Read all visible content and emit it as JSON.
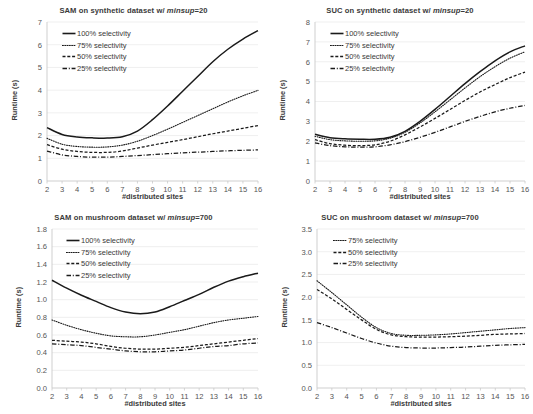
{
  "figure": {
    "panel_count": 4,
    "series_styles": {
      "100": "solid",
      "75": "dotted",
      "50": "dashed",
      "25": "dash-dot"
    },
    "colors": {
      "line": "#1a1a1a",
      "grid": "#e8e8e8",
      "axis": "#c9c9c9",
      "text": "#3a3a3a",
      "tick": "#555555",
      "background": "#ffffff"
    }
  },
  "charts": [
    {
      "id": "sam-synthetic",
      "title_prefix": "SAM on synthetic dataset w/ ",
      "title_italic": "minsup",
      "title_suffix": "=20",
      "title_full": "SAM on synthetic dataset w/ minsup=20",
      "chart_data": {
        "type": "line",
        "title": "SAM on synthetic dataset w/ minsup=20",
        "xlabel": "#distributed sites",
        "ylabel": "Runtime (s)",
        "x": [
          2,
          3,
          4,
          5,
          6,
          7,
          8,
          9,
          10,
          11,
          12,
          13,
          14,
          15,
          16
        ],
        "xlim": [
          2,
          16
        ],
        "ylim": [
          0,
          7
        ],
        "yticks": [
          0,
          1,
          2,
          3,
          4,
          5,
          6,
          7
        ],
        "xticks": [
          2,
          3,
          4,
          5,
          6,
          7,
          8,
          9,
          10,
          11,
          12,
          13,
          14,
          15,
          16
        ],
        "grid": true,
        "legend": "upper left",
        "series": [
          {
            "name": "100% selectivity",
            "style": "solid",
            "values": [
              2.35,
              2.05,
              1.94,
              1.9,
              1.89,
              1.95,
              2.2,
              2.7,
              3.3,
              3.95,
              4.6,
              5.25,
              5.8,
              6.25,
              6.62
            ]
          },
          {
            "name": "75% selectivity",
            "style": "dotted",
            "values": [
              1.88,
              1.62,
              1.52,
              1.49,
              1.5,
              1.58,
              1.75,
              2.0,
              2.28,
              2.58,
              2.88,
              3.18,
              3.48,
              3.75,
              3.99
            ]
          },
          {
            "name": "50% selectivity",
            "style": "dashed",
            "values": [
              1.6,
              1.4,
              1.3,
              1.26,
              1.26,
              1.32,
              1.45,
              1.58,
              1.7,
              1.82,
              1.95,
              2.08,
              2.2,
              2.32,
              2.44
            ]
          },
          {
            "name": "25% selectivity",
            "style": "dash-dot",
            "values": [
              1.32,
              1.15,
              1.08,
              1.05,
              1.05,
              1.08,
              1.12,
              1.16,
              1.2,
              1.24,
              1.27,
              1.3,
              1.33,
              1.35,
              1.37
            ]
          }
        ]
      }
    },
    {
      "id": "suc-synthetic",
      "title_prefix": "SUC on synthetic dataset w/ ",
      "title_italic": "minsup",
      "title_suffix": "=20",
      "title_full": "SUC on synthetic dataset w/ minsup=20",
      "chart_data": {
        "type": "line",
        "title": "SUC on synthetic dataset w/ minsup=20",
        "xlabel": "#distributed sites",
        "ylabel": "Runtime (s)",
        "x": [
          2,
          3,
          4,
          5,
          6,
          7,
          8,
          9,
          10,
          11,
          12,
          13,
          14,
          15,
          16
        ],
        "xlim": [
          2,
          16
        ],
        "ylim": [
          0,
          8
        ],
        "yticks": [
          0,
          1,
          2,
          3,
          4,
          5,
          6,
          7,
          8
        ],
        "xticks": [
          2,
          3,
          4,
          5,
          6,
          7,
          8,
          9,
          10,
          11,
          12,
          13,
          14,
          15,
          16
        ],
        "grid": true,
        "legend": "upper left",
        "series": [
          {
            "name": "100% selectivity",
            "style": "solid",
            "values": [
              2.35,
              2.18,
              2.12,
              2.1,
              2.1,
              2.2,
              2.5,
              3.0,
              3.6,
              4.25,
              4.9,
              5.5,
              6.05,
              6.5,
              6.8
            ]
          },
          {
            "name": "75% selectivity",
            "style": "dotted",
            "values": [
              2.25,
              2.08,
              2.02,
              2.0,
              2.02,
              2.15,
              2.45,
              2.92,
              3.48,
              4.08,
              4.68,
              5.25,
              5.75,
              6.18,
              6.5
            ]
          },
          {
            "name": "50% selectivity",
            "style": "dashed",
            "values": [
              2.08,
              1.88,
              1.8,
              1.78,
              1.82,
              2.0,
              2.32,
              2.72,
              3.15,
              3.6,
              4.05,
              4.48,
              4.85,
              5.2,
              5.48
            ]
          },
          {
            "name": "25% selectivity",
            "style": "dash-dot",
            "values": [
              1.92,
              1.78,
              1.72,
              1.7,
              1.72,
              1.82,
              1.98,
              2.2,
              2.45,
              2.72,
              3.0,
              3.25,
              3.48,
              3.66,
              3.8
            ]
          }
        ]
      }
    },
    {
      "id": "sam-mushroom",
      "title_prefix": "SAM on mushroom dataset w/ ",
      "title_italic": "minsup",
      "title_suffix": "=700",
      "title_full": "SAM on mushroom dataset w/ minsup=700",
      "chart_data": {
        "type": "line",
        "title": "SAM on mushroom dataset w/ minsup=700",
        "xlabel": "#distributed sites",
        "ylabel": "Runtime (s)",
        "x": [
          2,
          3,
          4,
          5,
          6,
          7,
          8,
          9,
          10,
          11,
          12,
          13,
          14,
          15,
          16
        ],
        "xlim": [
          2,
          16
        ],
        "ylim": [
          0.0,
          1.8
        ],
        "yticks": [
          0.0,
          0.2,
          0.4,
          0.6,
          0.8,
          1.0,
          1.2,
          1.4,
          1.6,
          1.8
        ],
        "ytick_labels": [
          "0.0",
          "0.2",
          "0.4",
          "0.6",
          "0.8",
          "1.0",
          "1.2",
          "1.4",
          "1.6",
          "1.8"
        ],
        "xticks": [
          2,
          3,
          4,
          5,
          6,
          7,
          8,
          9,
          10,
          11,
          12,
          13,
          14,
          15,
          16
        ],
        "grid": true,
        "legend": "upper left",
        "series": [
          {
            "name": "100% selectivity",
            "style": "solid",
            "values": [
              1.22,
              1.13,
              1.05,
              0.98,
              0.91,
              0.86,
              0.84,
              0.86,
              0.92,
              0.99,
              1.06,
              1.14,
              1.21,
              1.26,
              1.3
            ]
          },
          {
            "name": "75% selectivity",
            "style": "dotted",
            "values": [
              0.77,
              0.71,
              0.66,
              0.62,
              0.59,
              0.58,
              0.58,
              0.6,
              0.63,
              0.66,
              0.7,
              0.74,
              0.77,
              0.79,
              0.81
            ]
          },
          {
            "name": "50% selectivity",
            "style": "dashed",
            "values": [
              0.54,
              0.53,
              0.52,
              0.5,
              0.47,
              0.45,
              0.44,
              0.44,
              0.45,
              0.46,
              0.48,
              0.5,
              0.52,
              0.54,
              0.56
            ]
          },
          {
            "name": "25% selectivity",
            "style": "dash-dot",
            "values": [
              0.5,
              0.49,
              0.48,
              0.46,
              0.44,
              0.42,
              0.41,
              0.41,
              0.42,
              0.43,
              0.45,
              0.47,
              0.48,
              0.5,
              0.51
            ]
          }
        ]
      }
    },
    {
      "id": "suc-mushroom",
      "title_prefix": "SUC on mushroom dataset w/ ",
      "title_italic": "minsup",
      "title_suffix": "=700",
      "title_full": "SUC on mushroom dataset w/ minsup=700",
      "chart_data": {
        "type": "line",
        "title": "SUC on mushroom dataset w/ minsup=700",
        "xlabel": "#distributed sites",
        "ylabel": "Runtime (s)",
        "x": [
          2,
          3,
          4,
          5,
          6,
          7,
          8,
          9,
          10,
          11,
          12,
          13,
          14,
          15,
          16
        ],
        "xlim": [
          2,
          16
        ],
        "ylim": [
          0.0,
          3.5
        ],
        "yticks": [
          0.0,
          0.5,
          1.0,
          1.5,
          2.0,
          2.5,
          3.0,
          3.5
        ],
        "ytick_labels": [
          "0.0",
          "0.5",
          "1.0",
          "1.5",
          "2.0",
          "2.5",
          "3.0",
          "3.5"
        ],
        "xticks": [
          2,
          3,
          4,
          5,
          6,
          7,
          8,
          9,
          10,
          11,
          12,
          13,
          14,
          15,
          16
        ],
        "grid": true,
        "legend": "upper left",
        "series": [
          {
            "name": "75% selectivity",
            "style": "dotted",
            "values": [
              2.36,
              2.1,
              1.83,
              1.56,
              1.33,
              1.2,
              1.16,
              1.16,
              1.17,
              1.19,
              1.22,
              1.25,
              1.28,
              1.31,
              1.33
            ]
          },
          {
            "name": "50% selectivity",
            "style": "dashed",
            "values": [
              2.17,
              1.96,
              1.73,
              1.5,
              1.29,
              1.17,
              1.13,
              1.12,
              1.12,
              1.13,
              1.14,
              1.16,
              1.18,
              1.19,
              1.2
            ]
          },
          {
            "name": "25% selectivity",
            "style": "dash-dot",
            "values": [
              1.44,
              1.33,
              1.21,
              1.09,
              0.99,
              0.92,
              0.89,
              0.88,
              0.88,
              0.89,
              0.9,
              0.92,
              0.94,
              0.95,
              0.96
            ]
          }
        ]
      }
    }
  ]
}
